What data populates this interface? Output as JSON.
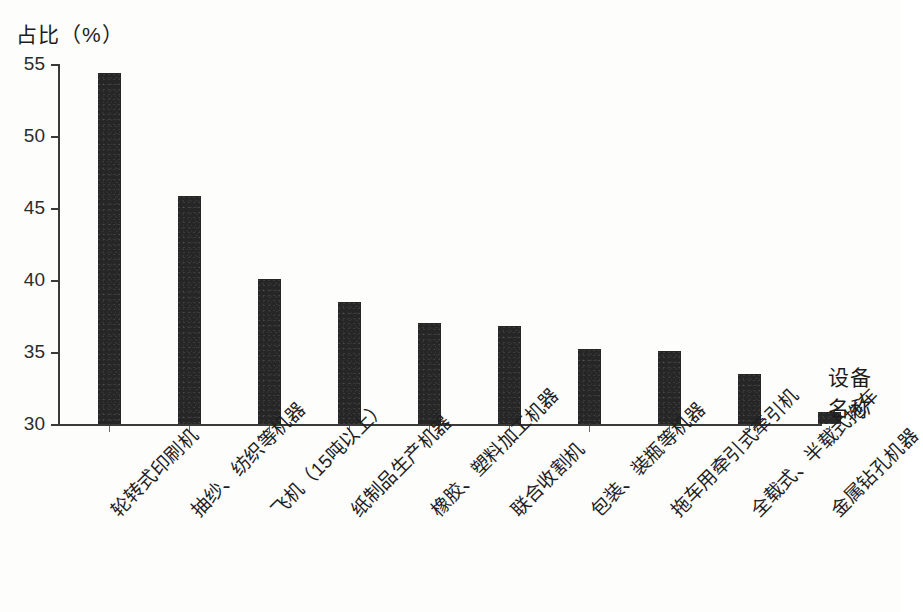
{
  "chart_data": {
    "type": "bar",
    "title": "占比（%）",
    "ylabel": "占比（%）",
    "xlabel": "设备名称",
    "xlabel_lines": [
      "设备",
      "名称"
    ],
    "ylim": [
      30,
      55
    ],
    "yticks": [
      30,
      35,
      40,
      45,
      50,
      55
    ],
    "ytick_labels": [
      "30",
      "35",
      "40",
      "45",
      "50",
      "55"
    ],
    "grid": false,
    "legend": null,
    "bar_color": "#262626",
    "axis_color": "#3a3a3a",
    "categories": [
      "轮转式印刷机",
      "抽纱、纺织等机器",
      "飞机（15吨以上）",
      "纸制品生产机器",
      "橡胶、塑料加工机器",
      "联合收割机",
      "包装、装瓶等机器",
      "拖车用牵引式牵引机",
      "全载式、半载式拖车",
      "金属钻孔机器"
    ],
    "values": [
      54.4,
      45.8,
      40.1,
      38.5,
      37.0,
      36.8,
      35.2,
      35.1,
      33.5,
      30.8
    ]
  }
}
